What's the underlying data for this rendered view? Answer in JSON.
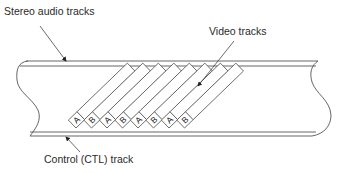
{
  "diagram": {
    "labels": {
      "stereo_audio": "Stereo audio tracks",
      "video": "Video tracks",
      "control": "Control (CTL) track"
    },
    "stripes": [
      "A",
      "B",
      "A",
      "B",
      "A",
      "B",
      "A",
      "B"
    ],
    "colors": {
      "line": "#555555",
      "text": "#2a2a2a",
      "background": "#ffffff"
    }
  }
}
